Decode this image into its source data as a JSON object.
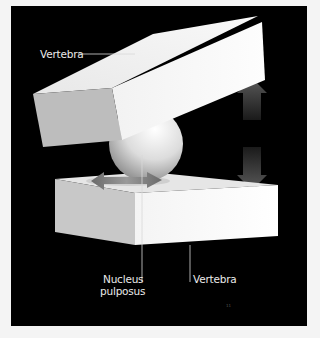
{
  "figure": {
    "background": "#000000",
    "page_background": "#f4f4f4",
    "labels": {
      "top_vertebra": "Vertebra",
      "nucleus": [
        "Nucleus",
        "pulposus"
      ],
      "bottom_vertebra": "Vertebra"
    },
    "page_number": "11",
    "elements": [
      "upper-vertebra-block",
      "nucleus-pulposus-sphere",
      "lower-vertebra-block",
      "vertical-compression-arrows",
      "horizontal-displacement-arrows"
    ]
  }
}
